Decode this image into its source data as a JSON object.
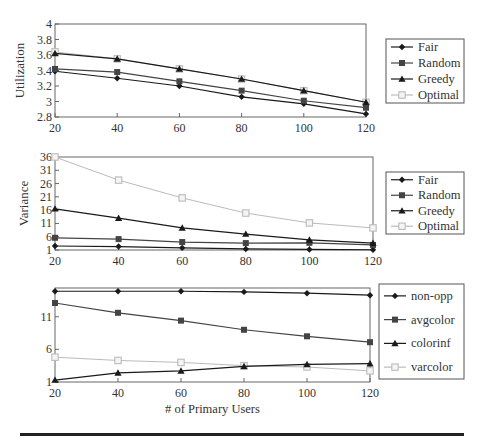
{
  "figure": {
    "x_label": "# of Primary Users"
  },
  "chart_data": [
    {
      "type": "line",
      "title": "",
      "xlabel": "",
      "ylabel": "Utilization",
      "x": [
        20,
        40,
        60,
        80,
        100,
        120
      ],
      "xlim": [
        20,
        120
      ],
      "ylim": [
        2.8,
        4.0
      ],
      "yticks": [
        2.8,
        3,
        3.2,
        3.4,
        3.6,
        3.8,
        4
      ],
      "ytick_labels": [
        "2.8",
        "3",
        "3.2",
        "3.4",
        "3.6",
        "3.8",
        "4"
      ],
      "xtick_labels": [
        "20",
        "40",
        "60",
        "80",
        "100",
        "120"
      ],
      "grid": false,
      "legend_position": "right",
      "series": [
        {
          "name": "Fair",
          "marker": "diamond",
          "color": "#1a1a1a",
          "values": [
            3.39,
            3.3,
            3.2,
            3.06,
            2.97,
            2.84
          ]
        },
        {
          "name": "Random",
          "marker": "square",
          "color": "#444444",
          "values": [
            3.42,
            3.38,
            3.26,
            3.14,
            3.01,
            2.92
          ]
        },
        {
          "name": "Greedy",
          "marker": "triangle",
          "color": "#1a1a1a",
          "values": [
            3.62,
            3.55,
            3.42,
            3.29,
            3.14,
            2.99
          ]
        },
        {
          "name": "Optimal",
          "marker": "open-square",
          "color": "#bbbbbb",
          "values": [
            3.64,
            3.55,
            3.42,
            3.29,
            3.14,
            2.99
          ]
        }
      ]
    },
    {
      "type": "line",
      "title": "",
      "xlabel": "",
      "ylabel": "Variance",
      "x": [
        20,
        40,
        60,
        80,
        100,
        120
      ],
      "xlim": [
        20,
        120
      ],
      "ylim": [
        1,
        36
      ],
      "yticks": [
        1,
        6,
        11,
        16,
        21,
        26,
        31,
        36
      ],
      "ytick_labels": [
        "1",
        "6",
        "11",
        "16",
        "21",
        "26",
        "31",
        "36"
      ],
      "xtick_labels": [
        "20",
        "40",
        "60",
        "80",
        "100",
        "120"
      ],
      "grid": false,
      "legend_position": "right",
      "series": [
        {
          "name": "Fair",
          "marker": "diamond",
          "color": "#1a1a1a",
          "values": [
            2.5,
            2.3,
            1.8,
            1.4,
            1.2,
            1.1
          ]
        },
        {
          "name": "Random",
          "marker": "square",
          "color": "#444444",
          "values": [
            5.6,
            5.1,
            4.0,
            3.6,
            3.7,
            2.9
          ]
        },
        {
          "name": "Greedy",
          "marker": "triangle",
          "color": "#1a1a1a",
          "values": [
            16.5,
            13.0,
            9.3,
            7.0,
            4.8,
            3.6
          ]
        },
        {
          "name": "Optimal",
          "marker": "open-square",
          "color": "#bbbbbb",
          "values": [
            36.0,
            27.3,
            20.6,
            14.9,
            11.2,
            9.3
          ]
        }
      ]
    },
    {
      "type": "line",
      "title": "",
      "xlabel": "# of Primary Users",
      "ylabel": "",
      "x": [
        20,
        40,
        60,
        80,
        100,
        120
      ],
      "xlim": [
        20,
        120
      ],
      "ylim": [
        1,
        15.4
      ],
      "yticks": [
        1,
        6,
        11
      ],
      "ytick_labels": [
        "1",
        "6",
        "11"
      ],
      "xtick_labels": [
        "20",
        "40",
        "60",
        "80",
        "100",
        "120"
      ],
      "grid": false,
      "legend_position": "right",
      "series": [
        {
          "name": "non-opp",
          "marker": "diamond",
          "color": "#1a1a1a",
          "values": [
            14.9,
            14.9,
            14.9,
            14.8,
            14.6,
            14.3
          ]
        },
        {
          "name": "avgcolor",
          "marker": "square",
          "color": "#444444",
          "values": [
            13.1,
            11.6,
            10.4,
            9.0,
            8.0,
            7.1
          ]
        },
        {
          "name": "colorinf",
          "marker": "triangle",
          "color": "#1a1a1a",
          "values": [
            1.3,
            2.4,
            2.7,
            3.4,
            3.7,
            3.8
          ]
        },
        {
          "name": "varcolor",
          "marker": "open-square",
          "color": "#bbbbbb",
          "values": [
            4.8,
            4.3,
            4.0,
            3.5,
            3.3,
            2.7
          ]
        }
      ]
    }
  ]
}
